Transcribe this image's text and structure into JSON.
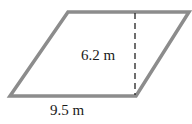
{
  "diagram": {
    "shape": "parallelogram",
    "height_label": "6.2 m",
    "base_label": "9.5 m",
    "colors": {
      "outline": "#8c8c8c",
      "dashed_line": "#222222",
      "text": "#1a1a1a",
      "background": "#ffffff"
    }
  }
}
